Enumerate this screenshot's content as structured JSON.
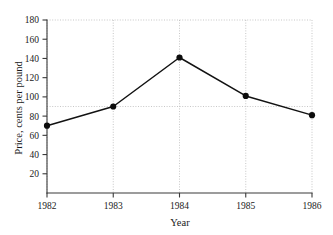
{
  "chart_data": {
    "type": "line",
    "title": "",
    "xlabel": "Year",
    "ylabel": "Price, cents per pound",
    "x": [
      1982,
      1983,
      1984,
      1985,
      1986
    ],
    "values": [
      70,
      90,
      141,
      101,
      81
    ],
    "xticklabels": [
      "1982",
      "1983",
      "1984",
      "1985",
      "1986"
    ],
    "yticklabels": [
      "20",
      "40",
      "60",
      "80",
      "100",
      "120",
      "140",
      "160",
      "180"
    ],
    "yticks": [
      20,
      40,
      60,
      80,
      100,
      120,
      140,
      160,
      180
    ],
    "xlim": [
      1982,
      1986
    ],
    "ylim": [
      0,
      180
    ],
    "grid": true,
    "grid_vertical_at": [
      1982,
      1983,
      1984,
      1985,
      1986
    ],
    "grid_horizontal_at": [
      90,
      180
    ],
    "legend": "none",
    "marker": "filled-circle",
    "line_color": "#121212",
    "marker_color": "#0d0d0d",
    "grid_color": "#b9b9b9",
    "axis_color": "#3a3a3a"
  },
  "axes": {
    "y_title": "Price, cents per pound",
    "x_title": "Year",
    "y_ticks": [
      {
        "label": "180",
        "value": 180
      },
      {
        "label": "160",
        "value": 160
      },
      {
        "label": "140",
        "value": 140
      },
      {
        "label": "120",
        "value": 120
      },
      {
        "label": "100",
        "value": 100
      },
      {
        "label": "80",
        "value": 80
      },
      {
        "label": "60",
        "value": 60
      },
      {
        "label": "40",
        "value": 40
      },
      {
        "label": "20",
        "value": 20
      }
    ],
    "x_ticks": [
      {
        "label": "1982",
        "value": 1982
      },
      {
        "label": "1983",
        "value": 1983
      },
      {
        "label": "1984",
        "value": 1984
      },
      {
        "label": "1985",
        "value": 1985
      },
      {
        "label": "1986",
        "value": 1986
      }
    ]
  },
  "points": [
    {
      "label": "1982",
      "value": "70"
    },
    {
      "label": "1983",
      "value": "90"
    },
    {
      "label": "1984",
      "value": "141"
    },
    {
      "label": "1985",
      "value": "101"
    },
    {
      "label": "1986",
      "value": "81"
    }
  ]
}
